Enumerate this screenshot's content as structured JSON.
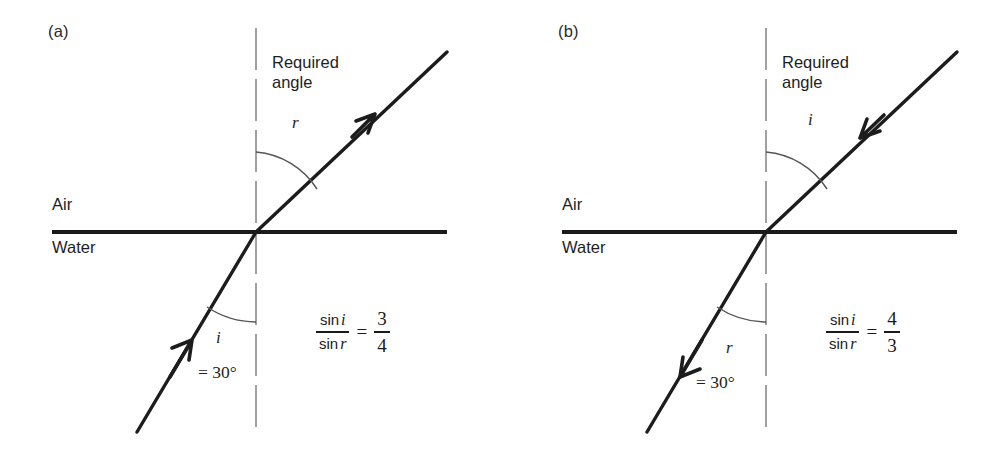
{
  "figure": {
    "colors": {
      "ray": "#1c1c1c",
      "interface": "#1a1a1a",
      "normal": "#8a8a8a",
      "arc": "#555555",
      "text": "#1e1e1e",
      "background": "#ffffff"
    }
  },
  "panels": [
    {
      "id": "a",
      "label": "(a)",
      "media": {
        "upper": "Air",
        "lower": "Water"
      },
      "required": {
        "line1": "Required",
        "line2": "angle",
        "symbol": "r"
      },
      "known": {
        "symbol": "i",
        "value": "= 30°"
      },
      "equation": {
        "numerator": "sin",
        "numerator_sym": "i",
        "denominator": "sin",
        "denominator_sym": "r",
        "equals": "=",
        "result_num": "3",
        "result_den": "4"
      },
      "ray_direction": "upward",
      "upper_angle_symbol": "r",
      "lower_angle_symbol": "i"
    },
    {
      "id": "b",
      "label": "(b)",
      "media": {
        "upper": "Air",
        "lower": "Water"
      },
      "required": {
        "line1": "Required",
        "line2": "angle",
        "symbol": "i"
      },
      "known": {
        "symbol": "r",
        "value": "= 30°"
      },
      "equation": {
        "numerator": "sin",
        "numerator_sym": "i",
        "denominator": "sin",
        "denominator_sym": "r",
        "equals": "=",
        "result_num": "4",
        "result_den": "3"
      },
      "ray_direction": "downward",
      "upper_angle_symbol": "i",
      "lower_angle_symbol": "r"
    }
  ]
}
